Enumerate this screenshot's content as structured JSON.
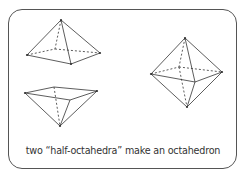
{
  "caption": "two “half-octahedra” make an octahedron",
  "figures": [
    {
      "name": "upper-half-octahedron",
      "description": "square pyramid, apex up"
    },
    {
      "name": "lower-half-octahedron",
      "description": "square pyramid, apex down"
    },
    {
      "name": "octahedron",
      "description": "full octahedron"
    }
  ],
  "colors": {
    "stroke": "#333333",
    "border": "#555555"
  }
}
